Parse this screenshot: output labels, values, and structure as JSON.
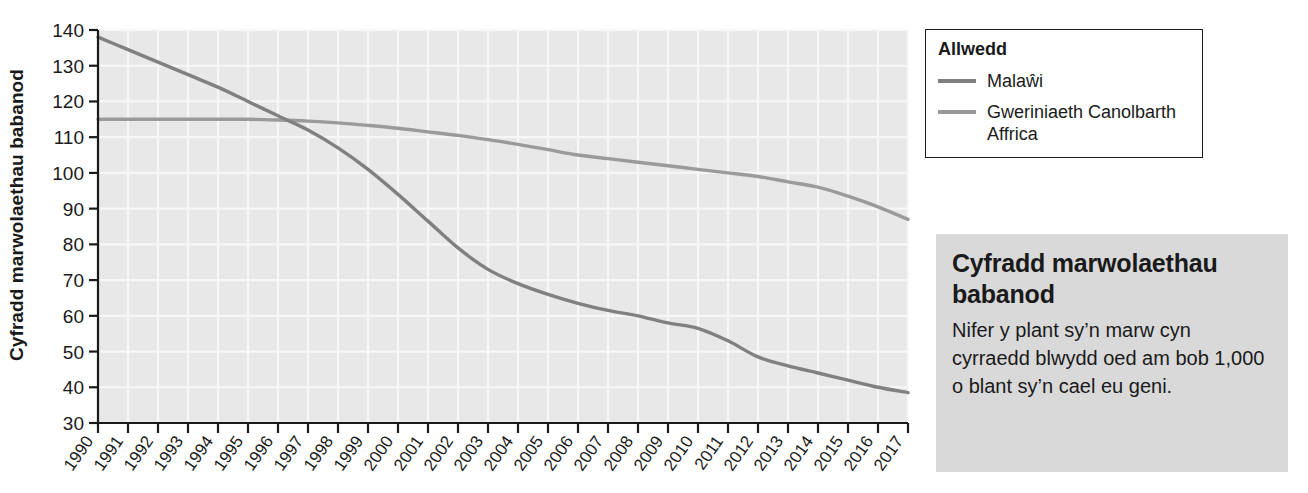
{
  "chart_data": {
    "type": "line",
    "title": "",
    "xlabel": "",
    "ylabel": "Cyfradd marwolaethau babanod",
    "ylim": [
      30,
      140
    ],
    "ytick_step": 10,
    "yticks": [
      30,
      40,
      50,
      60,
      70,
      80,
      90,
      100,
      110,
      120,
      130,
      140
    ],
    "grid": true,
    "legend_position": "outside-right-top",
    "x": [
      1990,
      1991,
      1992,
      1993,
      1994,
      1995,
      1996,
      1997,
      1998,
      1999,
      2000,
      2001,
      2002,
      2003,
      2004,
      2005,
      2006,
      2007,
      2008,
      2009,
      2010,
      2011,
      2012,
      2013,
      2014,
      2015,
      2016,
      2017
    ],
    "categories": [
      "1990",
      "1991",
      "1992",
      "1993",
      "1994",
      "1995",
      "1996",
      "1997",
      "1998",
      "1999",
      "2000",
      "2001",
      "2002",
      "2003",
      "2004",
      "2005",
      "2006",
      "2007",
      "2008",
      "2009",
      "2010",
      "2011",
      "2012",
      "2013",
      "2014",
      "2015",
      "2016",
      "2017"
    ],
    "series": [
      {
        "name": "Malaŵi",
        "color": "#808080",
        "values": [
          138,
          134.5,
          131,
          127.5,
          124,
          120,
          116,
          112,
          107,
          101,
          94,
          86.5,
          79,
          73,
          69,
          66,
          63.5,
          61.5,
          60,
          58,
          56.5,
          53,
          48.5,
          46,
          44,
          42,
          40,
          38.5
        ]
      },
      {
        "name": "Gweriniaeth Canolbarth Affrica",
        "color": "#9a9a9a",
        "values": [
          115,
          115,
          115,
          115,
          115,
          115,
          114.8,
          114.5,
          114,
          113.3,
          112.5,
          111.5,
          110.5,
          109.3,
          108,
          106.5,
          105,
          104,
          103,
          102,
          101,
          100,
          99,
          97.5,
          96,
          93.5,
          90.5,
          87
        ]
      }
    ]
  },
  "legend": {
    "title": "Allwedd",
    "items": [
      {
        "label": "Malaŵi",
        "color": "#808080"
      },
      {
        "label": "Gweriniaeth Canolbarth Affrica",
        "color": "#9a9a9a"
      }
    ]
  },
  "info_box": {
    "title": "Cyfradd marwolaethau babanod",
    "body": "Nifer y plant sy’n marw cyn cyrraedd blwydd oed am bob 1,000 o blant sy’n cael eu geni.",
    "background": "#d9d9d9"
  },
  "colors": {
    "plot_background": "#e8e8e8",
    "gridline": "#f7f7f7",
    "axis": "#1a1a1a",
    "text": "#1a1a1a"
  }
}
